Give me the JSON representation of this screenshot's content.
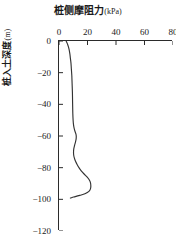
{
  "figure": {
    "background_color": "#ffffff",
    "axis_color": "#2b2b2b",
    "series_color": "#333333"
  },
  "chart_data": {
    "type": "line",
    "title": "桩侧摩阻力",
    "title_unit": "(kPa)",
    "xlabel": "桩侧摩阻力(kPa)",
    "ylabel": "桩入土深度",
    "ylabel_unit": "(m)",
    "xlim": [
      0,
      80
    ],
    "ylim": [
      -120,
      0
    ],
    "xticks": [
      0,
      20,
      40,
      60,
      80
    ],
    "xticklabels": [
      "0",
      "20",
      "40",
      "60",
      "80"
    ],
    "yticks": [
      0,
      -20,
      -40,
      -60,
      -80,
      -100,
      -120
    ],
    "yticklabels": [
      "0",
      "−20",
      "−40",
      "−60",
      "−80",
      "−100",
      "−120"
    ],
    "grid": false,
    "legend": null,
    "tick_direction": "in",
    "spines": [
      "left",
      "top"
    ],
    "series": [
      {
        "name": "桩侧摩阻力",
        "x": [
          5.0,
          6.2,
          7.0,
          7.6,
          8.0,
          8.4,
          8.7,
          9.0,
          9.2,
          9.4,
          9.5,
          9.6,
          9.7,
          9.9,
          10.2,
          10.6,
          11.2,
          11.8,
          12.1,
          12.0,
          11.5,
          10.9,
          10.4,
          10.2,
          10.3,
          10.8,
          11.6,
          12.7,
          14.0,
          15.6,
          17.6,
          19.8,
          21.4,
          22.2,
          22.2,
          21.0,
          18.2,
          14.6,
          11.4,
          9.2,
          8.0
        ],
        "y": [
          0,
          -2.5,
          -5,
          -8,
          -11,
          -14,
          -18,
          -22,
          -27,
          -32,
          -37,
          -42,
          -46,
          -50,
          -53,
          -55,
          -57,
          -58.5,
          -60,
          -62,
          -64,
          -66,
          -68,
          -70,
          -72,
          -74,
          -76,
          -78,
          -80,
          -82,
          -84,
          -86,
          -88,
          -90,
          -93,
          -95,
          -96.5,
          -97.5,
          -98.3,
          -98.8,
          -99.2
        ]
      }
    ]
  },
  "caption_sliver": ""
}
